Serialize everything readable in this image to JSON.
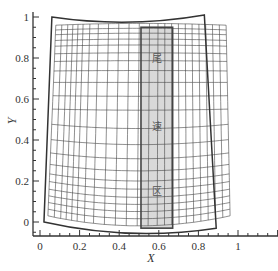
{
  "chart_data": {
    "type": "diagram-mesh",
    "title": "",
    "xlabel": "X",
    "ylabel": "Y",
    "xlim": [
      -0.02,
      1.2
    ],
    "ylim": [
      -0.07,
      1.04
    ],
    "x_ticks": [
      0,
      0.2,
      0.4,
      0.6,
      0.8,
      1
    ],
    "x_tick_labels": [
      "0",
      "0.2",
      "0.4",
      "0.6",
      "0.8",
      "1"
    ],
    "y_ticks": [
      0,
      0.2,
      0.4,
      0.6,
      0.8,
      1
    ],
    "y_tick_labels": [
      "0",
      "0.2",
      "0.4",
      "0.6",
      "0.8",
      "1"
    ],
    "grid": false,
    "outer_boundary": {
      "top_left": [
        0.06,
        1.0
      ],
      "top_right": [
        0.83,
        1.01
      ],
      "bottom_right": [
        0.89,
        -0.03
      ],
      "bottom_left": [
        0.02,
        0.0
      ],
      "top_sag": 0.03,
      "bottom_sag": 0.04
    },
    "mesh": {
      "top_left": [
        0.08,
        0.96
      ],
      "top_right": [
        0.94,
        0.96
      ],
      "bottom_right": [
        0.96,
        0.03
      ],
      "bottom_left": [
        0.04,
        0.03
      ],
      "columns": [
        0.0,
        0.035,
        0.07,
        0.1,
        0.13,
        0.16,
        0.2,
        0.25,
        0.31,
        0.37,
        0.43,
        0.49,
        0.55,
        0.6,
        0.64,
        0.68,
        0.72,
        0.76,
        0.8,
        0.84,
        0.88,
        0.92,
        0.96,
        1.0
      ],
      "rows": [
        0.0,
        0.035,
        0.07,
        0.105,
        0.14,
        0.18,
        0.22,
        0.27,
        0.33,
        0.4,
        0.48,
        0.56,
        0.63,
        0.7,
        0.76,
        0.81,
        0.85,
        0.89,
        0.92,
        0.95,
        0.975,
        1.0
      ]
    },
    "highlight_region": {
      "x": [
        0.51,
        0.67
      ],
      "y": [
        -0.03,
        0.95
      ],
      "fill": "#d9d9d9",
      "stroke": "#444444"
    },
    "annotations": [
      {
        "text": "尾",
        "x": 0.59,
        "y": 0.8
      },
      {
        "text": "速",
        "x": 0.59,
        "y": 0.47
      },
      {
        "text": "区",
        "x": 0.59,
        "y": 0.15
      }
    ]
  },
  "colors": {
    "axis": "#333333",
    "boundary": "#333333",
    "mesh": "#444444",
    "highlight_fill": "#d9d9d9"
  }
}
